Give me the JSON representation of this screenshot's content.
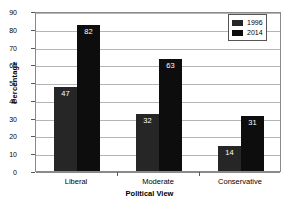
{
  "chart_data": {
    "type": "bar",
    "title": "",
    "subtitle": "",
    "xlabel": "Political View",
    "ylabel": "Percentage",
    "categories": [
      "Liberal",
      "Moderate",
      "Conservative"
    ],
    "series": [
      {
        "name": "1996",
        "values": [
          47,
          32,
          14
        ],
        "color": "#262626"
      },
      {
        "name": "2014",
        "values": [
          82,
          63,
          31
        ],
        "color": "#0d0d0d"
      }
    ],
    "ylim": [
      0,
      90
    ],
    "ytick_step": 10,
    "yticks": [
      0,
      10,
      20,
      30,
      40,
      50,
      60,
      70,
      80,
      90
    ],
    "ytick_labels": [
      "0",
      "10",
      "20",
      "30",
      "40",
      "50",
      "60",
      "70",
      "80",
      "90"
    ],
    "grid": true,
    "grid_axis": "y",
    "legend_position": "top-right",
    "value_labels": true,
    "value_label_color": "#ffffff",
    "data_labels": {
      "Liberal": {
        "1996": "47",
        "2014": "82"
      },
      "Moderate": {
        "1996": "32",
        "2014": "63"
      },
      "Conservative": {
        "1996": "14",
        "2014": "31"
      }
    }
  },
  "legend": {
    "entries": [
      {
        "label": "1996"
      },
      {
        "label": "2014"
      }
    ]
  },
  "axes": {
    "y_title": "Percentage",
    "x_title": "Political View"
  }
}
